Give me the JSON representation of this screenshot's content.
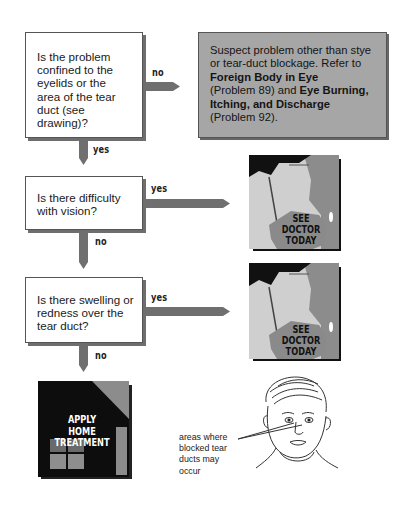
{
  "flowchart": {
    "question_1": {
      "lines": [
        "Is the problem",
        "confined to the",
        "eyelids or the",
        "area of the tear",
        "duct (see",
        "drawing)?"
      ]
    },
    "branch_1_no_label": "no",
    "branch_1_yes_label": "yes",
    "referral_box": {
      "line_1": "Suspect problem other than stye",
      "line_2": "or tear-duct blockage.  Refer to",
      "bold_1": "Foreign Body in Eye",
      "line_4_pre": "(Problem 89) and ",
      "bold_2a": "Eye Burning,",
      "bold_2b": "Itching, and Discharge",
      "line_6": "(Problem 92)."
    },
    "question_2": {
      "lines": [
        "Is there difficulty",
        "with vision?"
      ]
    },
    "branch_2_yes_label": "yes",
    "branch_2_no_label": "no",
    "question_3": {
      "lines": [
        "Is there swelling or",
        "redness over the",
        "tear duct?"
      ]
    },
    "branch_3_yes_label": "yes",
    "branch_3_no_label": "no",
    "outcome_doctor_1": {
      "lines": [
        "SEE",
        "DOCTOR",
        "TODAY"
      ]
    },
    "outcome_doctor_2": {
      "lines": [
        "SEE",
        "DOCTOR",
        "TODAY"
      ]
    },
    "outcome_home": {
      "lines": [
        "APPLY",
        "HOME",
        "TREATMENT"
      ]
    },
    "illustration_caption": {
      "lines": [
        "areas where",
        "blocked tear",
        "ducts may",
        "occur"
      ]
    }
  },
  "colors": {
    "arrow": "#6f6f6f",
    "referral_bg": "#a6a6a6",
    "box_shadow": "#6e6e6e",
    "doctor_bg": "#c9c9c9",
    "doctor_dark": "#111111",
    "doctor_mid": "#8a8a8a",
    "home_bg": "#0d0d0d",
    "home_accent": "#8c8c8c"
  }
}
